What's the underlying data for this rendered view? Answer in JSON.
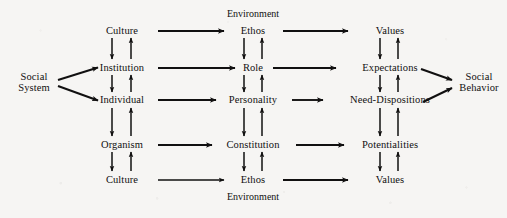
{
  "figure": {
    "type": "flow-diagram",
    "background_color": "#f6f5f3",
    "ink_color": "#111010",
    "boundary_labels": {
      "top": "Environment",
      "bottom": "Environment"
    },
    "source_node": {
      "line1": "Social",
      "line2": "System"
    },
    "sink_node": {
      "line1": "Social",
      "line2": "Behavior"
    },
    "columns": [
      {
        "id": "levels",
        "x": 122,
        "nodes": [
          {
            "id": "culture-top",
            "label": "Culture",
            "row": 0,
            "y": 31
          },
          {
            "id": "institution",
            "label": "Institution",
            "row": 1,
            "y": 68
          },
          {
            "id": "individual",
            "label": "Individual",
            "row": 2,
            "y": 100
          },
          {
            "id": "organism",
            "label": "Organism",
            "row": 3,
            "y": 145
          },
          {
            "id": "culture-bottom",
            "label": "Culture",
            "row": 4,
            "y": 180
          }
        ]
      },
      {
        "id": "patterns",
        "x": 253,
        "nodes": [
          {
            "id": "ethos-top",
            "label": "Ethos",
            "row": 0,
            "y": 31
          },
          {
            "id": "role",
            "label": "Role",
            "row": 1,
            "y": 68
          },
          {
            "id": "personality",
            "label": "Personality",
            "row": 2,
            "y": 100
          },
          {
            "id": "constitution",
            "label": "Constitution",
            "row": 3,
            "y": 145
          },
          {
            "id": "ethos-bottom",
            "label": "Ethos",
            "row": 4,
            "y": 180
          }
        ]
      },
      {
        "id": "orientations",
        "x": 390,
        "nodes": [
          {
            "id": "values-top",
            "label": "Values",
            "row": 0,
            "y": 31
          },
          {
            "id": "expectations",
            "label": "Expectations",
            "row": 1,
            "y": 68
          },
          {
            "id": "need-dispositions",
            "label": "Need-Dispositions",
            "row": 2,
            "y": 100
          },
          {
            "id": "potentialities",
            "label": "Potentialities",
            "row": 3,
            "y": 145
          },
          {
            "id": "values-bottom",
            "label": "Values",
            "row": 4,
            "y": 180
          }
        ]
      }
    ],
    "edges": {
      "horizontal": [
        {
          "from": "culture-top",
          "to": "ethos-top"
        },
        {
          "from": "institution",
          "to": "role"
        },
        {
          "from": "individual",
          "to": "personality"
        },
        {
          "from": "organism",
          "to": "constitution"
        },
        {
          "from": "culture-bottom",
          "to": "ethos-bottom"
        },
        {
          "from": "ethos-top",
          "to": "values-top"
        },
        {
          "from": "role",
          "to": "expectations"
        },
        {
          "from": "personality",
          "to": "need-dispositions"
        },
        {
          "from": "constitution",
          "to": "potentialities"
        },
        {
          "from": "ethos-bottom",
          "to": "values-bottom"
        }
      ],
      "vertical_down": [
        {
          "from": "culture-top",
          "to": "institution"
        },
        {
          "from": "institution",
          "to": "individual"
        },
        {
          "from": "individual",
          "to": "organism"
        },
        {
          "from": "organism",
          "to": "culture-bottom"
        },
        {
          "from": "ethos-top",
          "to": "role"
        },
        {
          "from": "role",
          "to": "personality"
        },
        {
          "from": "personality",
          "to": "constitution"
        },
        {
          "from": "constitution",
          "to": "ethos-bottom"
        },
        {
          "from": "values-top",
          "to": "expectations"
        },
        {
          "from": "expectations",
          "to": "need-dispositions"
        },
        {
          "from": "need-dispositions",
          "to": "potentialities"
        },
        {
          "from": "potentialities",
          "to": "values-bottom"
        }
      ],
      "vertical_up": [
        {
          "from": "institution",
          "to": "culture-top"
        },
        {
          "from": "individual",
          "to": "institution"
        },
        {
          "from": "organism",
          "to": "individual"
        },
        {
          "from": "culture-bottom",
          "to": "organism"
        },
        {
          "from": "role",
          "to": "ethos-top"
        },
        {
          "from": "personality",
          "to": "role"
        },
        {
          "from": "constitution",
          "to": "personality"
        },
        {
          "from": "ethos-bottom",
          "to": "constitution"
        },
        {
          "from": "expectations",
          "to": "values-top"
        },
        {
          "from": "need-dispositions",
          "to": "expectations"
        },
        {
          "from": "potentialities",
          "to": "need-dispositions"
        },
        {
          "from": "values-bottom",
          "to": "potentialities"
        }
      ],
      "diagonal": [
        {
          "from": "social-system",
          "to": "institution"
        },
        {
          "from": "social-system",
          "to": "individual"
        },
        {
          "from": "expectations",
          "to": "social-behavior"
        },
        {
          "from": "need-dispositions",
          "to": "social-behavior"
        }
      ]
    }
  }
}
